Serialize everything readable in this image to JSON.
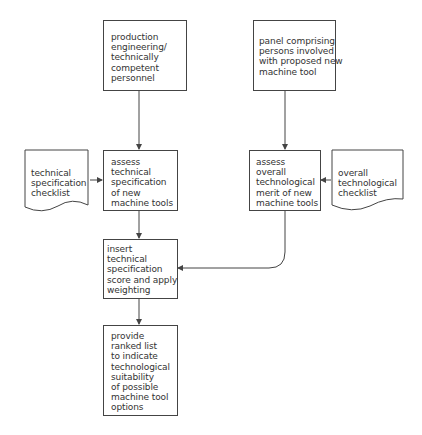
{
  "diagram": {
    "type": "flowchart",
    "nodes": {
      "production": {
        "label": "production\nengineering/\ntechnically\ncompetent\npersonnel",
        "shape": "process"
      },
      "panel": {
        "label": "panel comprising\npersons involved\nwith proposed new\nmachine tool",
        "shape": "process"
      },
      "tech_checklist": {
        "label": "technical\nspecification\nchecklist",
        "shape": "document"
      },
      "assess_tech": {
        "label": "assess\ntechnical\nspecification\nof new\nmachine tools",
        "shape": "process"
      },
      "assess_overall": {
        "label": "assess\noverall\ntechnological\nmerit of new\nmachine tools",
        "shape": "process"
      },
      "overall_checklist": {
        "label": "overall\ntechnological\nchecklist",
        "shape": "document"
      },
      "insert_score": {
        "label": "insert\ntechnical\nspecification\nscore and apply\nweighting",
        "shape": "process"
      },
      "ranked_list": {
        "label": "provide\nranked list\nto indicate\ntechnological\nsuitability\nof possible\nmachine tool\noptions",
        "shape": "process"
      }
    },
    "edges": [
      {
        "from": "production",
        "to": "assess_tech"
      },
      {
        "from": "panel",
        "to": "assess_overall"
      },
      {
        "from": "tech_checklist",
        "to": "assess_tech"
      },
      {
        "from": "overall_checklist",
        "to": "assess_overall"
      },
      {
        "from": "assess_tech",
        "to": "insert_score"
      },
      {
        "from": "assess_overall",
        "to": "insert_score"
      },
      {
        "from": "insert_score",
        "to": "ranked_list"
      }
    ],
    "colors": {
      "stroke": "#444444",
      "text": "#333333",
      "background": "#ffffff"
    }
  }
}
